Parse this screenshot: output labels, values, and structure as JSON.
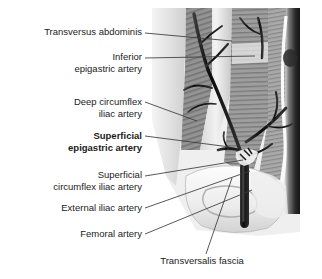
{
  "figure": {
    "background_color": "#ffffff",
    "text_color": "#1b1b1b",
    "vessel_color": "#111111",
    "leader_line_color": "#3a3a3a",
    "labels": [
      {
        "id": "transversus-abdominis",
        "text": "Transversus abdominis",
        "lines": [
          "Transversus abdominis"
        ],
        "bold": false,
        "align": "right",
        "x": 10,
        "y": 27,
        "width": 132,
        "leader": {
          "x1": 145,
          "y1": 33,
          "x2": 232,
          "y2": 41
        }
      },
      {
        "id": "inferior-epigastric-artery",
        "text": "Inferior epigastric artery",
        "lines": [
          "Inferior",
          "epigastric artery"
        ],
        "bold": false,
        "align": "right",
        "x": 10,
        "y": 52,
        "width": 132,
        "leader": {
          "x1": 145,
          "y1": 58,
          "x2": 255,
          "y2": 56
        }
      },
      {
        "id": "deep-circumflex-iliac-artery",
        "text": "Deep circumflex iliac artery",
        "lines": [
          "Deep circumflex",
          "iliac artery"
        ],
        "bold": false,
        "align": "right",
        "x": 10,
        "y": 97,
        "width": 132,
        "leader": {
          "x1": 145,
          "y1": 102,
          "x2": 197,
          "y2": 121
        }
      },
      {
        "id": "superficial-epigastric-artery",
        "text": "Superficial epigastric artery",
        "lines": [
          "Superficial",
          "epigastric artery"
        ],
        "bold": true,
        "align": "right",
        "x": 10,
        "y": 131,
        "width": 132,
        "leader": {
          "x1": 145,
          "y1": 136,
          "x2": 230,
          "y2": 147
        }
      },
      {
        "id": "superficial-circumflex-iliac-artery",
        "text": "Superficial circumflex iliac artery",
        "lines": [
          "Superficial",
          "circumflex iliac artery"
        ],
        "bold": false,
        "align": "right",
        "x": 8,
        "y": 170,
        "width": 134,
        "leader": {
          "x1": 145,
          "y1": 176,
          "x2": 243,
          "y2": 160
        }
      },
      {
        "id": "external-iliac-artery",
        "text": "External iliac artery",
        "lines": [
          "External iliac artery"
        ],
        "bold": false,
        "align": "right",
        "x": 10,
        "y": 203,
        "width": 132,
        "leader": {
          "x1": 145,
          "y1": 208,
          "x2": 250,
          "y2": 171
        }
      },
      {
        "id": "femoral-artery",
        "text": "Femoral artery",
        "lines": [
          "Femoral artery"
        ],
        "bold": false,
        "align": "right",
        "x": 10,
        "y": 229,
        "width": 132,
        "leader": {
          "x1": 145,
          "y1": 234,
          "x2": 252,
          "y2": 190
        }
      },
      {
        "id": "transversalis-fascia",
        "text": "Transversalis fascia",
        "lines": [
          "Transversalis fascia"
        ],
        "bold": false,
        "align": "center",
        "x": 148,
        "y": 256,
        "width": 108,
        "leader": {
          "x1": 206,
          "y1": 254,
          "x2": 232,
          "y2": 178
        }
      }
    ]
  }
}
